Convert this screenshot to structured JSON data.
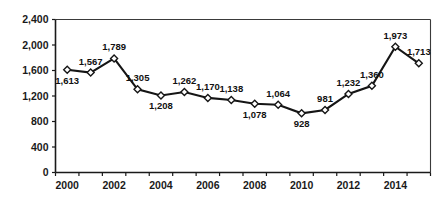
{
  "chart_data": {
    "type": "line",
    "title": "",
    "subtitle": "",
    "xlabel": "",
    "ylabel": "",
    "grid": false,
    "legend": false,
    "legend_position": "none",
    "line_color": "#151515",
    "marker_color": "#ffffff",
    "marker_edge_color": "#151515",
    "marker_shape": "diamond",
    "ylim": [
      0,
      2400
    ],
    "ytick_labels": [
      "0",
      "400",
      "800",
      "1,200",
      "1,600",
      "2,000",
      "2,400"
    ],
    "ytick_values": [
      0,
      400,
      800,
      1200,
      1600,
      2000,
      2400
    ],
    "xtick_labels": [
      "2000",
      "2002",
      "2004",
      "2006",
      "2008",
      "2010",
      "2012",
      "2014"
    ],
    "xtick_values": [
      2000,
      2002,
      2004,
      2006,
      2008,
      2010,
      2012,
      2014
    ],
    "categories": [
      "2000",
      "2001",
      "2002",
      "2003",
      "2004",
      "2005",
      "2006",
      "2007",
      "2008",
      "2009",
      "2010",
      "2011",
      "2012",
      "2013",
      "2014",
      "2015"
    ],
    "values": [
      1613,
      1567,
      1789,
      1305,
      1208,
      1262,
      1170,
      1138,
      1078,
      1064,
      928,
      981,
      1232,
      1360,
      1973,
      1713
    ],
    "point_labels": [
      "1,613",
      "1,567",
      "1,789",
      "1,305",
      "1,208",
      "1,262",
      "1,170",
      "1,138",
      "1,078",
      "1,064",
      "928",
      "981",
      "1,232",
      "1,360",
      "1,973",
      "1,713"
    ],
    "point_label_positions": [
      "below",
      "above",
      "above",
      "above",
      "below",
      "above",
      "above",
      "above",
      "below",
      "above",
      "below",
      "above",
      "above",
      "above",
      "above",
      "above"
    ]
  }
}
